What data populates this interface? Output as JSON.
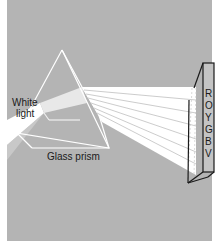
{
  "figure": {
    "background_color": "#b4b4b4",
    "beam_color": "#ffffff",
    "labels": {
      "white_light_line1": "White",
      "white_light_line2": "light",
      "prism": "Glass prism"
    },
    "spectrum": {
      "letters": [
        "R",
        "O",
        "Y",
        "G",
        "B",
        "V"
      ]
    }
  }
}
